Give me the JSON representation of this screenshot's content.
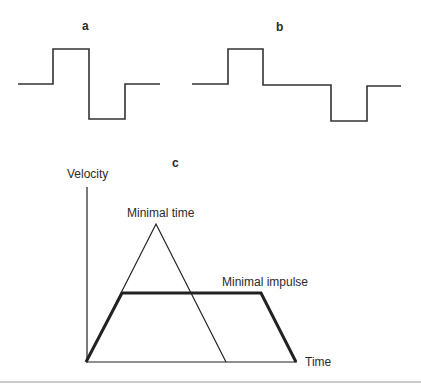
{
  "panels": {
    "a": {
      "label": "a"
    },
    "b": {
      "label": "b"
    },
    "c": {
      "label": "c",
      "y_axis_label": "Velocity",
      "x_axis_label": "Time",
      "curve_labels": {
        "minimal_time": "Minimal time",
        "minimal_impulse": "Minimal impulse"
      }
    }
  },
  "colors": {
    "line": "#333333",
    "divider": "#999999"
  }
}
